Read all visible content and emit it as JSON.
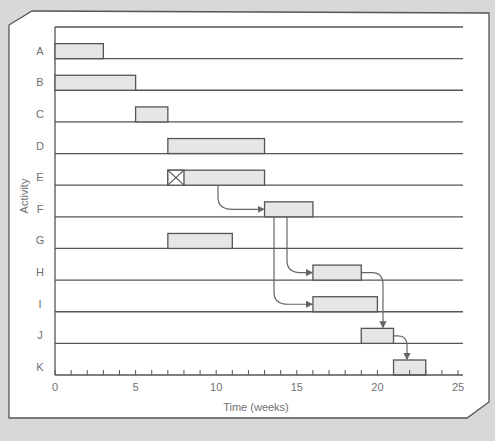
{
  "chart_data": {
    "type": "gantt",
    "title": "",
    "xlabel": "Time (weeks)",
    "ylabel": "Activity",
    "xlim": [
      0,
      25
    ],
    "x_ticks": [
      0,
      5,
      10,
      15,
      20,
      25
    ],
    "minor_tick_step": 1,
    "grid": "horizontal row lines",
    "categories": [
      "A",
      "B",
      "C",
      "D",
      "E",
      "F",
      "G",
      "H",
      "I",
      "J",
      "K"
    ],
    "bars": [
      {
        "activity": "A",
        "start": 0,
        "end": 3
      },
      {
        "activity": "B",
        "start": 0,
        "end": 5
      },
      {
        "activity": "C",
        "start": 5,
        "end": 7
      },
      {
        "activity": "D",
        "start": 7,
        "end": 13
      },
      {
        "activity": "E",
        "start": 7,
        "end": 13,
        "crossed_segment": [
          7,
          8
        ]
      },
      {
        "activity": "F",
        "start": 13,
        "end": 16
      },
      {
        "activity": "G",
        "start": 7,
        "end": 11
      },
      {
        "activity": "H",
        "start": 16,
        "end": 19
      },
      {
        "activity": "I",
        "start": 16,
        "end": 20
      },
      {
        "activity": "J",
        "start": 19,
        "end": 21
      },
      {
        "activity": "K",
        "start": 21,
        "end": 23
      }
    ],
    "dependencies": [
      {
        "from": "E",
        "to": "F"
      },
      {
        "from": "F",
        "to": "H"
      },
      {
        "from": "F",
        "to": "I"
      },
      {
        "from": "H",
        "to": "J"
      },
      {
        "from": "J",
        "to": "K"
      }
    ],
    "colors": {
      "bar_fill": "#e6e6e6",
      "bar_stroke": "#555555",
      "line": "#555555",
      "arrow": "#666666",
      "panel": "#ffffff",
      "background": "#d8d8d8"
    }
  }
}
